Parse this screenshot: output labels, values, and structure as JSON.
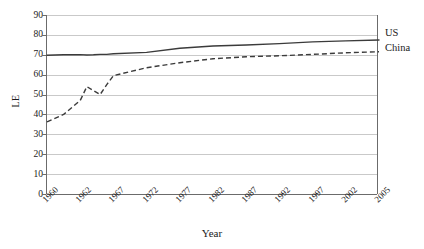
{
  "chart_data": {
    "type": "line",
    "title": "",
    "xlabel": "Year",
    "ylabel": "LE",
    "categories": [
      "1960",
      "1962",
      "1967",
      "1972",
      "1977",
      "1982",
      "1987",
      "1992",
      "1997",
      "2002",
      "2005"
    ],
    "x_tick_labels": [
      "1960",
      "1962",
      "1967",
      "1972",
      "1977",
      "1982",
      "1987",
      "1992",
      "1997",
      "2002",
      "2005"
    ],
    "y_tick_labels": [
      "0",
      "10",
      "20",
      "30",
      "40",
      "50",
      "60",
      "70",
      "80",
      "90"
    ],
    "y_ticks": [
      0,
      10,
      20,
      30,
      40,
      50,
      60,
      70,
      80,
      90
    ],
    "ylim": [
      0,
      90
    ],
    "grid": "horizontal",
    "legend_position": "right-of-plot-direct-labels",
    "series": [
      {
        "name": "US",
        "style": "solid",
        "color": "#3b3b3b",
        "x": [
          "1960",
          "1961",
          "1962",
          "1963",
          "1964",
          "1965",
          "1966",
          "1967",
          "1972",
          "1977",
          "1982",
          "1987",
          "1992",
          "1997",
          "2002",
          "2005"
        ],
        "values": [
          69.8,
          70.0,
          70.1,
          69.9,
          70.0,
          70.2,
          70.2,
          70.5,
          71.2,
          73.3,
          74.4,
          74.9,
          75.6,
          76.5,
          77.0,
          77.4
        ]
      },
      {
        "name": "China",
        "style": "dashed",
        "color": "#3b3b3b",
        "x": [
          "1960",
          "1961",
          "1962",
          "1963",
          "1964",
          "1965",
          "1966",
          "1967",
          "1972",
          "1977",
          "1982",
          "1987",
          "1992",
          "1997",
          "2002",
          "2005"
        ],
        "values": [
          36.3,
          40.0,
          47.0,
          54.0,
          52.0,
          50.0,
          55.0,
          59.5,
          63.5,
          66.0,
          68.0,
          69.0,
          69.5,
          70.2,
          71.0,
          71.5
        ]
      }
    ],
    "annotations": [
      {
        "text": "US",
        "anchor": "right-end-of-solid-series"
      },
      {
        "text": "China",
        "anchor": "right-end-of-dashed-series"
      }
    ]
  },
  "axes": {
    "y_title": "LE",
    "x_title": "Year"
  },
  "labels": {
    "us": "US",
    "china": "China"
  }
}
